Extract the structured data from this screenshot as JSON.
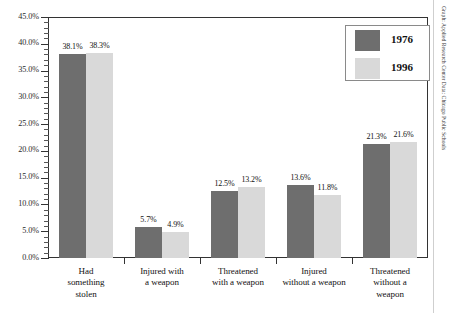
{
  "chart_data": {
    "type": "bar",
    "title": "",
    "subtitle": "",
    "xlabel": "",
    "ylabel": "",
    "ylim": [
      0,
      45
    ],
    "ytick_step": 5,
    "yminor_step": 1,
    "grid": false,
    "value_format": "percent",
    "legend_position": "top-right",
    "categories": [
      "Had something stolen",
      "Injured with a weapon",
      "Threatened with a weapon",
      "Injured without a weapon",
      "Threatened without a weapon"
    ],
    "category_lines": [
      [
        "Had",
        "something",
        "stolen"
      ],
      [
        "Injured with",
        "a weapon"
      ],
      [
        "Threatened",
        "with a weapon"
      ],
      [
        "Injured",
        "without a weapon"
      ],
      [
        "Threatened",
        "without a",
        "weapon"
      ]
    ],
    "series": [
      {
        "name": "1976",
        "color": "#6e6e6e",
        "values": [
          38.1,
          5.7,
          12.5,
          13.6,
          21.3
        ],
        "labels": [
          "38.1%",
          "5.7%",
          "12.5%",
          "13.6%",
          "21.3%"
        ]
      },
      {
        "name": "1996",
        "color": "#d9d9d9",
        "values": [
          38.3,
          4.9,
          13.2,
          11.8,
          21.6
        ],
        "labels": [
          "38.3%",
          "4.9%",
          "13.2%",
          "11.8%",
          "21.6%"
        ]
      }
    ],
    "ytick_labels": [
      "0.0%",
      "5.0%",
      "10.0%",
      "15.0%",
      "20.0%",
      "25.0%",
      "30.0%",
      "35.0%",
      "40.0%",
      "45.0%"
    ],
    "ytick_values": [
      0,
      5,
      10,
      15,
      20,
      25,
      30,
      35,
      40,
      45
    ]
  },
  "legend": {
    "items": [
      {
        "label": "1976",
        "color": "#6e6e6e"
      },
      {
        "label": "1996",
        "color": "#d9d9d9"
      }
    ]
  },
  "credit": {
    "text": "Graph: Applied Research Center  Data: Chicago Public Schools"
  },
  "colors": {
    "series_1976": "#6e6e6e",
    "series_1996": "#d9d9d9",
    "axis": "#333333",
    "background": "#ffffff",
    "text": "#111111"
  }
}
